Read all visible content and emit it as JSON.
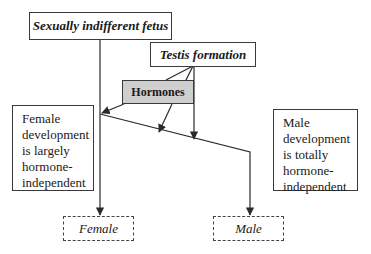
{
  "diagram": {
    "nodes": {
      "fetus": {
        "label": "Sexually indifferent fetus"
      },
      "testis": {
        "label": "Testis formation"
      },
      "hormones": {
        "label": "Hormones"
      },
      "female_note": {
        "label": "Female\ndevelopment\nis largely\nhormone-\nindependent"
      },
      "male_note": {
        "label": "Male\ndevelopment\nis totally\nhormone-\nindependent"
      },
      "female": {
        "label": "Female"
      },
      "male": {
        "label": "Male"
      }
    },
    "edges": [
      {
        "from": "fetus",
        "to": "female"
      },
      {
        "from": "testis",
        "to": "hormones"
      },
      {
        "from": "testis",
        "to": "male-path"
      },
      {
        "from": "hormones",
        "to": "female-path"
      },
      {
        "from": "hormones",
        "to": "male-path"
      },
      {
        "from": "male-path",
        "to": "male"
      }
    ],
    "colors": {
      "line": "#2a2a2a",
      "hormones_fill": "#cfcfcf",
      "border": "#3a3a3a"
    }
  }
}
